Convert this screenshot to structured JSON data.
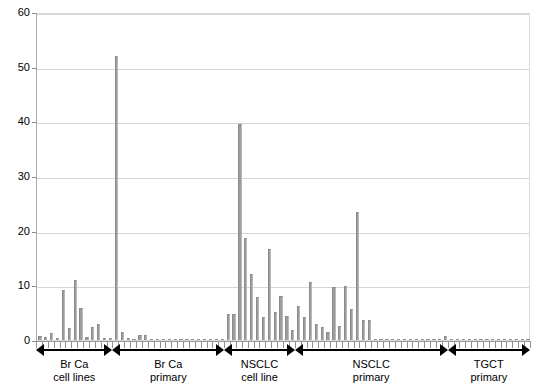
{
  "chart_data": {
    "type": "bar",
    "title": "",
    "xlabel": "",
    "ylabel": "",
    "ylim": [
      0,
      60
    ],
    "ytick_labels": [
      "0",
      "10",
      "20",
      "30",
      "40",
      "50",
      "60"
    ],
    "ytick_values": [
      0,
      10,
      20,
      30,
      40,
      50,
      60
    ],
    "grid": "horizontal",
    "legend": "none",
    "bar_color": "#9d9d9d",
    "groups": [
      {
        "label_line1": "Br Ca",
        "label_line2": "cell lines",
        "values": [
          0.8,
          0.6,
          1.2,
          0.4,
          9.1,
          2.2,
          11.0,
          5.8,
          0.5,
          2.3,
          3.0,
          0.4,
          0.3
        ]
      },
      {
        "label_line1": "Br Ca",
        "label_line2": "primary",
        "values": [
          52.0,
          1.5,
          0.3,
          0.2,
          1.0,
          0.9,
          0.2,
          0.1,
          0.1,
          0.2,
          0.1,
          0.1,
          0.1,
          0.1,
          0.1,
          0.1,
          0.1,
          0.1,
          0.1
        ]
      },
      {
        "label_line1": "NSCLC",
        "label_line2": "cell line",
        "values": [
          4.7,
          4.8,
          39.5,
          18.6,
          12.0,
          7.8,
          4.3,
          16.6,
          5.2,
          8.0,
          4.4,
          1.9
        ]
      },
      {
        "label_line1": "NSCLC",
        "label_line2": "primary",
        "values": [
          6.3,
          4.2,
          10.6,
          2.9,
          2.3,
          1.5,
          9.7,
          2.6,
          9.9,
          5.6,
          23.5,
          3.7,
          3.6,
          0.2,
          0.2,
          0.1,
          0.1,
          0.2,
          0.1,
          0.1,
          0.1,
          0.1,
          0.2,
          0.1,
          0.1,
          0.8
        ]
      },
      {
        "label_line1": "TGCT",
        "label_line2": "primary",
        "values": [
          0.2,
          0.1,
          0.1,
          0.2,
          0.1,
          0.1,
          0.1,
          0.2,
          0.1,
          0.1,
          0.1,
          0.2,
          0.1,
          0.1
        ]
      }
    ]
  }
}
